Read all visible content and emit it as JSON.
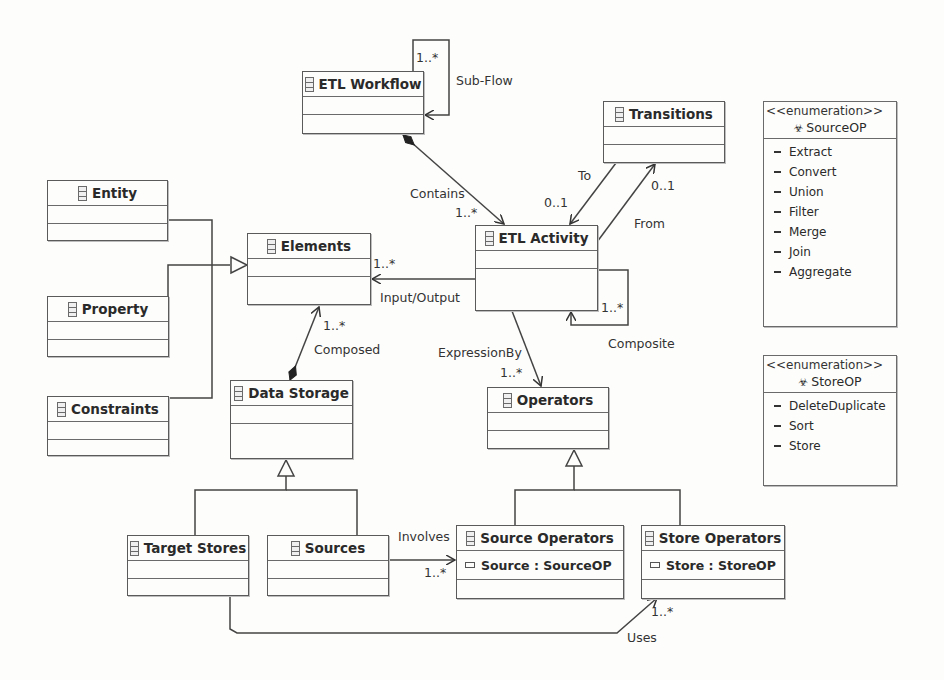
{
  "diagram": {
    "type": "UML class diagram",
    "classes": [
      {
        "id": "etl_workflow",
        "name": "ETL Workflow"
      },
      {
        "id": "transitions",
        "name": "Transitions"
      },
      {
        "id": "entity",
        "name": "Entity"
      },
      {
        "id": "elements",
        "name": "Elements"
      },
      {
        "id": "etl_activity",
        "name": "ETL Activity"
      },
      {
        "id": "property",
        "name": "Property"
      },
      {
        "id": "constraints",
        "name": "Constraints"
      },
      {
        "id": "data_storage",
        "name": "Data Storage"
      },
      {
        "id": "operators",
        "name": "Operators"
      },
      {
        "id": "target_stores",
        "name": "Target Stores"
      },
      {
        "id": "sources",
        "name": "Sources"
      },
      {
        "id": "source_operators",
        "name": "Source Operators",
        "attribute": "Source : SourceOP"
      },
      {
        "id": "store_operators",
        "name": "Store Operators",
        "attribute": "Store : StoreOP"
      }
    ],
    "enumerations": [
      {
        "stereotype": "<<enumeration>>",
        "name": "SourceOP",
        "literals": [
          "Extract",
          "Convert",
          "Union",
          "Filter",
          "Merge",
          "Join",
          "Aggregate"
        ]
      },
      {
        "stereotype": "<<enumeration>>",
        "name": "StoreOP",
        "literals": [
          "DeleteDuplicate",
          "Sort",
          "Store"
        ]
      }
    ],
    "labels": {
      "subflow_mult": "1..*",
      "subflow": "Sub-Flow",
      "contains": "Contains",
      "contains_mult": "1..*",
      "to": "To",
      "to_mult": "0..1",
      "from": "From",
      "from_mult": "0..1",
      "io_mult": "1..*",
      "io": "Input/Output",
      "composite_mult": "1..*",
      "composite": "Composite",
      "composed_mult": "1..*",
      "composed": "Composed",
      "expression_by": "ExpressionBy",
      "expression_mult": "1..*",
      "involves": "Involves",
      "involves_mult": "1..*",
      "uses": "Uses",
      "uses_mult": "1..*"
    }
  }
}
